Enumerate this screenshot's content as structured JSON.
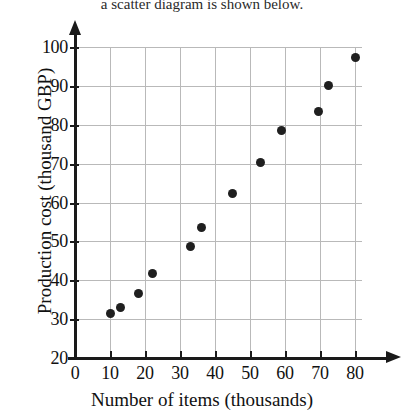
{
  "top_text": "a scatter diagram is shown below.",
  "chart_data": {
    "type": "scatter",
    "title": "",
    "xlabel": "Number of items (thousands)",
    "ylabel": "Production cost (thousand GBP)",
    "xlim": [
      0,
      82
    ],
    "ylim": [
      20,
      100
    ],
    "xticks": [
      0,
      10,
      20,
      30,
      40,
      50,
      60,
      70,
      80
    ],
    "yticks": [
      20,
      30,
      40,
      50,
      60,
      70,
      80,
      90,
      100
    ],
    "xtick_labels": [
      "0",
      "10",
      "20",
      "30",
      "40",
      "50",
      "60",
      "70",
      "80"
    ],
    "ytick_labels": [
      "20",
      "30",
      "40",
      "50",
      "60",
      "70",
      "80",
      "90",
      "100"
    ],
    "grid": true,
    "legend": "none",
    "marker_color": "#1f1f1f",
    "points": [
      {
        "x": 10.0,
        "y": 31.5
      },
      {
        "x": 13.0,
        "y": 33.0
      },
      {
        "x": 18.0,
        "y": 36.5
      },
      {
        "x": 22.0,
        "y": 41.7
      },
      {
        "x": 33.0,
        "y": 48.7
      },
      {
        "x": 36.0,
        "y": 53.5
      },
      {
        "x": 45.0,
        "y": 62.3
      },
      {
        "x": 53.0,
        "y": 70.3
      },
      {
        "x": 59.0,
        "y": 78.4
      },
      {
        "x": 69.5,
        "y": 83.4
      },
      {
        "x": 72.5,
        "y": 90.2
      },
      {
        "x": 80.0,
        "y": 97.4
      }
    ]
  }
}
